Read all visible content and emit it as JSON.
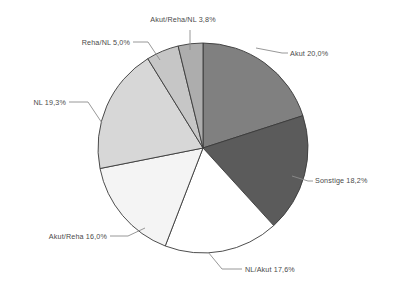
{
  "chart_data": {
    "type": "pie",
    "title": "",
    "subtitle": "",
    "xlabel": "",
    "ylabel": "",
    "legend_position": "none",
    "grid": false,
    "units": "percent",
    "decimal_separator": ",",
    "start_angle_deg": 0,
    "direction": "clockwise",
    "categories": [
      "Akut",
      "Sonstige",
      "NL/Akut",
      "Akut/Reha",
      "NL",
      "Reha/NL",
      "Akut/Reha/NL"
    ],
    "values": [
      20.0,
      18.2,
      17.6,
      16.0,
      19.3,
      5.0,
      3.8
    ],
    "slices": [
      {
        "name": "Akut",
        "value": 20.0,
        "label": "Akut 20,0%",
        "value_text": "20,0%",
        "color": "#808080",
        "label_anchor": "start",
        "label_x": 290,
        "label_y": 56,
        "leader": "M 256,48 L 282,53 L 288,53"
      },
      {
        "name": "Sonstige",
        "value": 18.2,
        "label": "Sonstige 18,2%",
        "value_text": "18,2%",
        "color": "#5b5b5b",
        "label_anchor": "start",
        "label_x": 315,
        "label_y": 183,
        "leader": "M 292,176 L 308,181 L 313,181"
      },
      {
        "name": "NL/Akut",
        "value": 17.6,
        "label": "NL/Akut 17,6%",
        "value_text": "17,6%",
        "color": "#ffffff",
        "label_anchor": "start",
        "label_x": 245,
        "label_y": 272,
        "leader": "M 208,252 L 222,269 L 242,269"
      },
      {
        "name": "Akut/Reha",
        "value": 16.0,
        "label": "Akut/Reha 16,0%",
        "value_text": "16,0%",
        "color": "#f4f4f4",
        "label_anchor": "end",
        "label_x": 107,
        "label_y": 239,
        "leader": "M 145,228 L 128,236 L 110,236"
      },
      {
        "name": "NL",
        "value": 19.3,
        "label": "NL 19,3%",
        "value_text": "19,3%",
        "color": "#d7d7d7",
        "label_anchor": "end",
        "label_x": 66,
        "label_y": 105,
        "leader": "M 102,123 L 88,102 L 69,102"
      },
      {
        "name": "Reha/NL",
        "value": 5.0,
        "label": "Reha/NL 5,0%",
        "value_text": "5,0%",
        "color": "#c6c6c6",
        "label_anchor": "end",
        "label_x": 130,
        "label_y": 45,
        "leader": "M 160,60 L 148,42 L 133,42"
      },
      {
        "name": "Akut/Reha/NL",
        "value": 3.8,
        "label": "Akut/Reha/NL 3,8%",
        "value_text": "3,8%",
        "color": "#adadad",
        "label_anchor": "mid",
        "label_x": 183,
        "label_y": 22,
        "leader": "M 190,50 L 190,30"
      }
    ],
    "geometry": {
      "center_x": 203,
      "center_y": 148,
      "radius": 105
    },
    "colors": {
      "background": "#ffffff",
      "slice_outline": "#3a3a3a",
      "leader_line": "#8c8c8c",
      "label_text": "#4a4a4a"
    }
  }
}
